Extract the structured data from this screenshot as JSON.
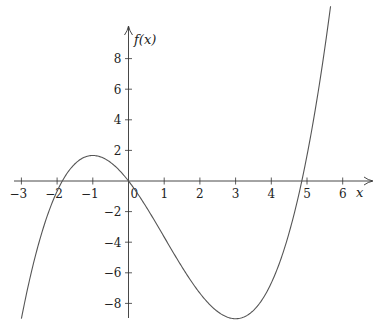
{
  "chart_data": {
    "type": "line",
    "title": "",
    "xlabel": "x",
    "ylabel": "f(x)",
    "function": "f(x) = x^3/3 - x^2 - 3x",
    "xlim": [
      -3.3,
      6.9
    ],
    "ylim": [
      -9.0,
      11.0
    ],
    "x_ticks": [
      -3,
      -2,
      -1,
      1,
      2,
      3,
      4,
      5,
      6
    ],
    "y_ticks": [
      -8,
      -6,
      -4,
      -2,
      2,
      4,
      6,
      8
    ],
    "x_tick_labels": [
      "−3",
      "−2",
      "−1",
      "1",
      "2",
      "3",
      "4",
      "5",
      "6"
    ],
    "y_tick_labels": [
      "−8",
      "−6",
      "−4",
      "−2",
      "2",
      "4",
      "6",
      "8"
    ],
    "origin_label": "0",
    "grid": false,
    "legend": null,
    "series": [
      {
        "name": "f(x)",
        "domain": [
          -3.0,
          5.66
        ],
        "x": [
          -3.0,
          -2.5,
          -2.0,
          -1.854,
          -1.5,
          -1.0,
          -0.5,
          0.0,
          0.5,
          1.0,
          1.5,
          2.0,
          2.5,
          3.0,
          3.5,
          4.0,
          4.5,
          4.854,
          5.0,
          5.5,
          5.66
        ],
        "values": [
          -9.0,
          -3.96,
          0.67,
          0.0,
          1.88,
          1.67,
          1.21,
          0.0,
          -1.71,
          -3.67,
          -5.63,
          -7.33,
          -8.54,
          -9.0,
          -8.46,
          -6.67,
          -3.38,
          0.0,
          1.67,
          8.21,
          11.4
        ]
      }
    ],
    "features": {
      "roots": [
        -1.854,
        0,
        4.854
      ],
      "local_max": [
        -1,
        1.667
      ],
      "local_min": [
        3,
        -9
      ]
    }
  },
  "axes": {
    "x_label": "x",
    "y_label": "f(x)"
  }
}
